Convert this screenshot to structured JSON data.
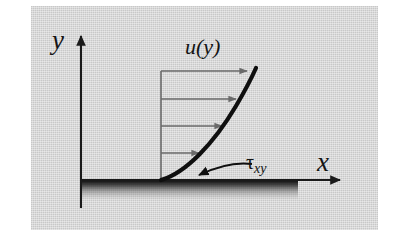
{
  "figure": {
    "kind": "technical-diagram",
    "panel": {
      "background_color": "#d2d2d2",
      "outer_background_color": "#ffffff"
    },
    "labels": {
      "y_axis": "y",
      "x_axis": "x",
      "velocity_profile": "u(y)",
      "shear_stress_symbol": "τ",
      "shear_stress_subscript": "xy"
    },
    "colors": {
      "axis": "#1a1a1a",
      "profile_curve": "#0f0f0f",
      "velocity_arrows": "#6a6a6a",
      "profile_baseline": "#6a6a6a",
      "wall_shadow": "#0d0d0d",
      "text": "#141414"
    },
    "geometry": {
      "y_axis_x": 81,
      "x_axis_y": 180,
      "y_axis_top_tip": 32,
      "y_axis_bottom": 208,
      "x_axis_right_tip": 345,
      "profile_base_x": 161,
      "profile_top_x": 255,
      "profile_top_y": 70,
      "wall_shadow_start_x": 81,
      "wall_shadow_end_x": 298,
      "wall_shadow_depth": 18
    },
    "velocity_arrows": [
      {
        "y": 71,
        "x_start": 161,
        "x_end": 251
      },
      {
        "y": 99,
        "x_start": 161,
        "x_end": 240
      },
      {
        "y": 126,
        "x_start": 161,
        "x_end": 226
      },
      {
        "y": 153,
        "x_start": 161,
        "x_end": 203
      }
    ]
  }
}
